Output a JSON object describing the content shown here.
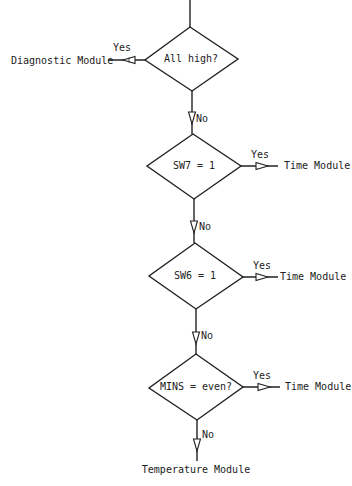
{
  "diagram": {
    "type": "flowchart",
    "colors": {
      "stroke": "#222222",
      "background": "#ffffff",
      "text": "#222222"
    },
    "decisions": [
      {
        "id": "d1",
        "text": "All high?",
        "yes_label": "Yes",
        "yes_target": "Diagnostic Module",
        "no_label": "No"
      },
      {
        "id": "d2",
        "text": "SW7 = 1",
        "yes_label": "Yes",
        "yes_target": "Time Module",
        "no_label": "No"
      },
      {
        "id": "d3",
        "text": "SW6 = 1",
        "yes_label": "Yes",
        "yes_target": "Time Module",
        "no_label": "No"
      },
      {
        "id": "d4",
        "text": "MINS = even?",
        "yes_label": "Yes",
        "yes_target": "Time Module",
        "no_label": "No"
      }
    ],
    "final_target": "Temperature Module"
  }
}
